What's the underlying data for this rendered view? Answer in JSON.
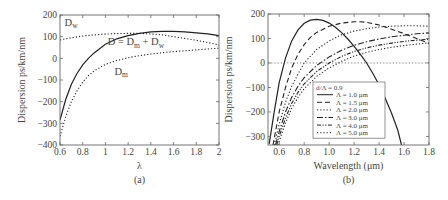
{
  "figure": {
    "panels": [
      "(a)",
      "(b)"
    ]
  },
  "chart_data": [
    {
      "type": "line",
      "panel_label": "(a)",
      "title": "",
      "xlabel": "λ",
      "ylabel": "Dispersion ps/km/nm",
      "xlim": [
        0.6,
        2.0
      ],
      "ylim": [
        -400,
        200
      ],
      "xticks": [
        0.6,
        0.8,
        1,
        1.2,
        1.4,
        1.6,
        1.8,
        2
      ],
      "xtick_labels": [
        "0.6",
        "0.8",
        "1",
        "1.2",
        "1.4",
        "1.6",
        "1.8",
        "2"
      ],
      "yticks": [
        -400,
        -300,
        -200,
        -100,
        0,
        100,
        200
      ],
      "ytick_labels": [
        "−400",
        "−300",
        "−200",
        "−100",
        "0",
        "100",
        "200"
      ],
      "grid": false,
      "legend": "none (inline annotations)",
      "annotations": [
        {
          "text": "D",
          "sub": "w",
          "x": 0.64,
          "y": 150
        },
        {
          "text": "D = D",
          "sub": "m",
          "tail": " + D",
          "tail_sub": "w",
          "x": 1.02,
          "y": 60
        },
        {
          "text": "D",
          "sub": "m",
          "x": 1.08,
          "y": -75
        }
      ],
      "series": [
        {
          "name": "D = Dm + Dw",
          "style": "solid",
          "x": [
            0.6,
            0.65,
            0.7,
            0.75,
            0.8,
            0.85,
            0.9,
            1.0,
            1.1,
            1.2,
            1.3,
            1.4,
            1.5,
            1.6,
            1.7,
            1.8,
            1.9,
            2.0
          ],
          "y": [
            -285,
            -190,
            -120,
            -70,
            -30,
            0,
            25,
            65,
            90,
            105,
            115,
            122,
            125,
            125,
            122,
            118,
            113,
            105
          ]
        },
        {
          "name": "Dw",
          "style": "dotted",
          "x": [
            0.6,
            0.7,
            0.8,
            0.9,
            1.0,
            1.1,
            1.2,
            1.3,
            1.4,
            1.5,
            1.6,
            1.7,
            1.8,
            1.9,
            2.0
          ],
          "y": [
            85,
            95,
            103,
            108,
            112,
            114,
            115,
            115,
            113,
            108,
            100,
            92,
            83,
            73,
            62
          ]
        },
        {
          "name": "Dm",
          "style": "dotted",
          "x": [
            0.6,
            0.65,
            0.7,
            0.75,
            0.8,
            0.85,
            0.9,
            1.0,
            1.1,
            1.2,
            1.3,
            1.4,
            1.5,
            1.6,
            1.7,
            1.8,
            1.9,
            2.0
          ],
          "y": [
            -360,
            -270,
            -200,
            -150,
            -110,
            -80,
            -58,
            -28,
            -10,
            3,
            12,
            20,
            26,
            31,
            35,
            39,
            43,
            47
          ]
        }
      ]
    },
    {
      "type": "line",
      "panel_label": "(b)",
      "title": "",
      "xlabel": "Wavelength (μm)",
      "ylabel": "Dispersion ps/km/nm",
      "xlim": [
        0.51,
        1.8
      ],
      "ylim": [
        -335,
        200
      ],
      "xticks": [
        0.6,
        0.8,
        1.0,
        1.2,
        1.4,
        1.6,
        1.8
      ],
      "xtick_labels": [
        "0.6",
        "0.8",
        "1.0",
        "1.2",
        "1.4",
        "1.6",
        "1.8"
      ],
      "yticks": [
        -300,
        -200,
        -100,
        0,
        100,
        200
      ],
      "ytick_labels": [
        "−300",
        "−200",
        "−100",
        "0",
        "100",
        "200"
      ],
      "grid": false,
      "zero_line": "dotted",
      "legend": {
        "position": "lower center",
        "title": "d/Λ = 0.9",
        "entries": [
          "Λ = 1.0 μm",
          "Λ = 1.5 μm",
          "Λ = 2.0 μm",
          "Λ = 3.0 μm",
          "Λ = 4.0 μm",
          "Λ = 5.0 μm"
        ]
      },
      "series": [
        {
          "name": "Λ = 1.0 μm",
          "style": "solid",
          "x": [
            0.52,
            0.56,
            0.6,
            0.65,
            0.7,
            0.75,
            0.8,
            0.85,
            0.9,
            0.95,
            1.0,
            1.05,
            1.1,
            1.15,
            1.2,
            1.25,
            1.3,
            1.35,
            1.4,
            1.45,
            1.5,
            1.55,
            1.58
          ],
          "y": [
            -330,
            -200,
            -80,
            20,
            90,
            135,
            162,
            175,
            178,
            174,
            163,
            146,
            124,
            98,
            68,
            35,
            0,
            -42,
            -90,
            -145,
            -205,
            -275,
            -335
          ]
        },
        {
          "name": "Λ = 1.5 μm",
          "style": "dashed",
          "x": [
            0.55,
            0.6,
            0.65,
            0.7,
            0.75,
            0.8,
            0.85,
            0.9,
            1.0,
            1.1,
            1.2,
            1.25,
            1.3,
            1.4,
            1.5,
            1.6,
            1.7,
            1.8
          ],
          "y": [
            -335,
            -200,
            -100,
            -20,
            35,
            75,
            105,
            125,
            150,
            163,
            168,
            168,
            166,
            155,
            138,
            120,
            100,
            80
          ]
        },
        {
          "name": "Λ = 2.0 μm",
          "style": "dotted",
          "x": [
            0.56,
            0.6,
            0.65,
            0.7,
            0.75,
            0.8,
            0.9,
            1.0,
            1.1,
            1.2,
            1.3,
            1.4,
            1.5,
            1.6,
            1.7,
            1.8
          ],
          "y": [
            -335,
            -250,
            -160,
            -95,
            -45,
            0,
            55,
            90,
            115,
            130,
            140,
            147,
            150,
            152,
            152,
            150
          ]
        },
        {
          "name": "Λ = 3.0 μm",
          "style": "dashdot",
          "x": [
            0.57,
            0.6,
            0.65,
            0.7,
            0.75,
            0.8,
            0.9,
            1.0,
            1.1,
            1.2,
            1.3,
            1.4,
            1.5,
            1.6,
            1.7,
            1.8
          ],
          "y": [
            -335,
            -280,
            -200,
            -140,
            -95,
            -60,
            -10,
            25,
            52,
            72,
            87,
            98,
            107,
            113,
            119,
            123
          ]
        },
        {
          "name": "Λ = 4.0 μm",
          "style": "dashdotdot",
          "x": [
            0.58,
            0.6,
            0.65,
            0.7,
            0.75,
            0.8,
            0.9,
            1.0,
            1.1,
            1.2,
            1.3,
            1.4,
            1.5,
            1.6,
            1.7,
            1.8
          ],
          "y": [
            -335,
            -300,
            -225,
            -165,
            -120,
            -85,
            -35,
            0,
            27,
            47,
            62,
            73,
            81,
            88,
            93,
            97
          ]
        },
        {
          "name": "Λ = 5.0 μm",
          "style": "dotted",
          "x": [
            0.59,
            0.6,
            0.65,
            0.7,
            0.75,
            0.8,
            0.9,
            1.0,
            1.1,
            1.2,
            1.3,
            1.4,
            1.5,
            1.6,
            1.7,
            1.8
          ],
          "y": [
            -335,
            -320,
            -245,
            -185,
            -140,
            -105,
            -55,
            -20,
            7,
            28,
            43,
            55,
            64,
            71,
            77,
            82
          ]
        }
      ]
    }
  ]
}
